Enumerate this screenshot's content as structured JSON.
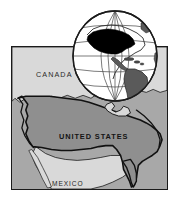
{
  "figure": {
    "kind": "reference-map",
    "background_color": "#ffffff"
  },
  "map": {
    "name": "united-states-reference-map",
    "frame_color": "#1b1b1b",
    "ocean_color": "#a8a8a8",
    "neighbor_color": "#d9d9d9",
    "united_states_color": "#8f8f8f",
    "coast_line_color": "#111111",
    "labels": {
      "canada": "CANADA",
      "united_states": "UNITED STATES",
      "mexico": "MEXICO"
    }
  },
  "globe": {
    "name": "globe-inset",
    "sphere_color": "#ffffff",
    "graticule_color": "#3a3a3a",
    "outline_color": "#1b1b1b",
    "landmass_color": "#5a5a5a",
    "highlight_color": "#000000",
    "highlight_region": "United States",
    "continents_shown": "North America, Central America, South America",
    "meridian_count": 5,
    "parallel_count": 5
  }
}
